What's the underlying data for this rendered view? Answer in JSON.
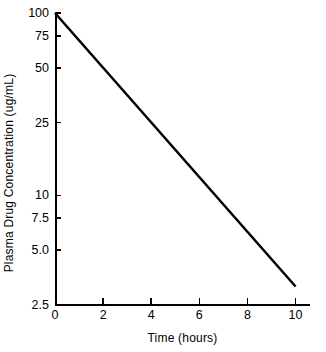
{
  "chart_data": {
    "type": "line",
    "title": "",
    "xlabel": "Time (hours)",
    "ylabel": "Plasma Drug Concentration (ug/mL)",
    "yscale": "log",
    "xscale": "linear",
    "xlim": [
      0,
      10.6
    ],
    "ylim": [
      2.5,
      100
    ],
    "grid": false,
    "legend": null,
    "xticks": [
      0,
      2,
      4,
      6,
      8,
      10
    ],
    "xticklabels": [
      "0",
      "2",
      "4",
      "6",
      "8",
      "10"
    ],
    "yticks": [
      2.5,
      5.0,
      7.5,
      10,
      25,
      50,
      75,
      100
    ],
    "yticklabels": [
      "2.5",
      "5.0",
      "7.5",
      "10",
      "25",
      "50",
      "75",
      "100"
    ],
    "series": [
      {
        "name": "Plasma drug concentration",
        "x": [
          0,
          10
        ],
        "values": [
          100,
          3.16
        ],
        "color": "#000000",
        "linewidth": 2.5,
        "style": "solid"
      }
    ]
  },
  "axes": {
    "y_title": "Plasma Drug Concentration (ug/mL)",
    "x_title": "Time (hours)",
    "y_labels": [
      "100",
      "75",
      "50",
      "25",
      "10",
      "7.5",
      "5.0",
      "2.5"
    ],
    "x_labels": [
      "0",
      "2",
      "4",
      "6",
      "8",
      "10"
    ]
  },
  "colors": {
    "background": "#ffffff",
    "axis": "#000000",
    "line": "#000000",
    "text": "#000000"
  }
}
